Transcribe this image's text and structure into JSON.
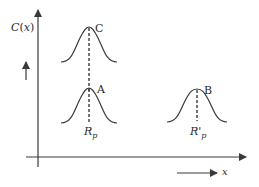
{
  "diagram": {
    "type": "concentration-profile",
    "y_axis_label": "C(x)",
    "x_axis_label": "x",
    "colors": {
      "line": "#3a3a3a",
      "background": "#ffffff"
    },
    "peaks": [
      {
        "id": "C",
        "label": "C",
        "position_label": ""
      },
      {
        "id": "A",
        "label": "A",
        "position_label": "Rp",
        "position_main": "R",
        "position_sub": "p"
      },
      {
        "id": "B",
        "label": "B",
        "position_label": "R'p",
        "position_main": "R'",
        "position_sub": "p"
      }
    ],
    "annotations": {
      "up_arrow": "increasing C",
      "right_arrow": "increasing x"
    }
  }
}
